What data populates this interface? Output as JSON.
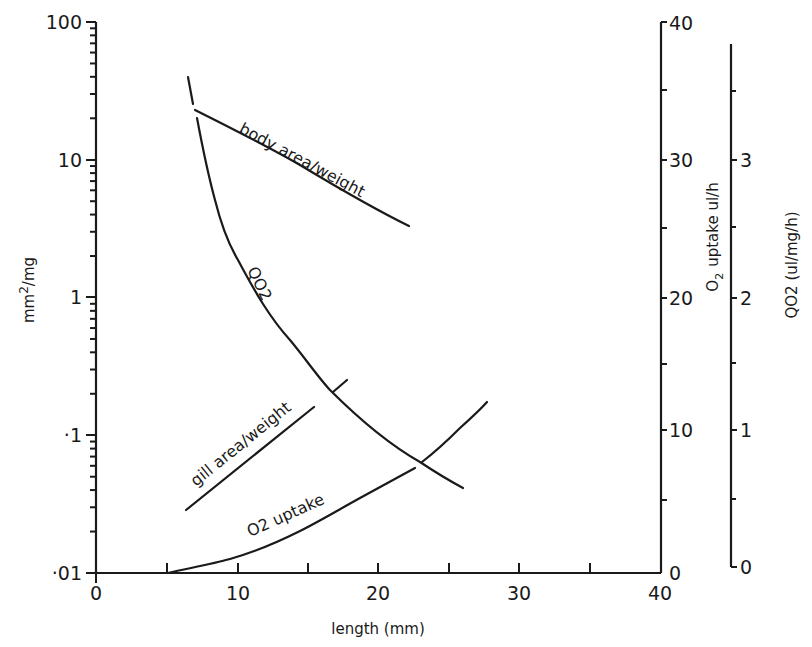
{
  "chart_data": {
    "type": "line",
    "title": "",
    "xlabel": "length (mm)",
    "xlim": [
      0,
      40
    ],
    "x_ticks": [
      "0",
      "10",
      "20",
      "30",
      "40"
    ],
    "axes": {
      "left": {
        "label": "mm2/mg",
        "label_main": "mm",
        "label_sup": "2",
        "label_tail": "/mg",
        "scale": "log",
        "ylim": [
          0.01,
          100
        ],
        "ticks": [
          "·01",
          "·1",
          "1",
          "10",
          "100"
        ]
      },
      "right1": {
        "label": "O2 uptake ul/h",
        "label_o": "O",
        "label_sub": "2",
        "label_tail": "uptake ul/h",
        "scale": "linear",
        "ylim": [
          0,
          40
        ],
        "ticks": [
          "0",
          "10",
          "20",
          "30",
          "40"
        ]
      },
      "right2": {
        "label": "QO2 (ul/mg/h)",
        "scale": "linear",
        "ylim": [
          0,
          3.8
        ],
        "ticks": [
          "0",
          "1",
          "2",
          "3"
        ]
      }
    },
    "grid": false,
    "legend": "none (curves labeled inline)",
    "series": [
      {
        "name": "body area/weight",
        "axis": "left",
        "x": [
          7.0,
          10.2,
          14.4,
          18.7,
          22.2
        ],
        "y": [
          23,
          16.5,
          9.0,
          5.0,
          3.3
        ]
      },
      {
        "name": "gill area/weight",
        "axis": "left",
        "x": [
          6.4,
          15.4
        ],
        "y": [
          0.029,
          0.16
        ],
        "extension": {
          "x": [
            16.8,
            17.8
          ],
          "y": [
            0.2,
            0.25
          ]
        }
      },
      {
        "name": "QO2",
        "axis": "right2",
        "x": [
          6.5,
          7.2,
          8.4,
          10.0,
          13.8,
          16.6,
          23.0,
          26.0
        ],
        "y": [
          3.59,
          3.29,
          2.69,
          2.25,
          1.66,
          1.3,
          0.77,
          0.58
        ]
      },
      {
        "name": "O2 uptake",
        "axis": "right1",
        "x": [
          5.1,
          9.5,
          14.5,
          18.7,
          22.6,
          25.3,
          27.7
        ],
        "y": [
          0.0,
          0.9,
          3.1,
          5.4,
          7.6,
          10.0,
          12.4
        ]
      }
    ],
    "annotations": [
      "body area/weight",
      "QO2",
      "gill area/weight",
      "O2 uptake"
    ]
  },
  "labels": {
    "body": "body area/weight",
    "qo2": "QO2",
    "gill": "gill area/weight",
    "o2": "O2 uptake"
  }
}
